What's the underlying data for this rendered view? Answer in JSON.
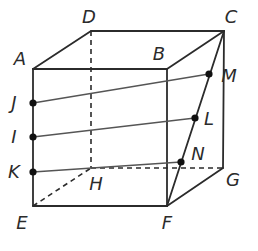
{
  "diagram": {
    "type": "cube-with-cross-section",
    "vertices": {
      "A": {
        "label": "A",
        "x": 33,
        "y": 69,
        "lx": 20,
        "ly": 59
      },
      "B": {
        "label": "B",
        "x": 167,
        "y": 69,
        "lx": 159,
        "ly": 54
      },
      "C": {
        "label": "C",
        "x": 224,
        "y": 31,
        "lx": 231,
        "ly": 17
      },
      "D": {
        "label": "D",
        "x": 91,
        "y": 31,
        "lx": 89,
        "ly": 17
      },
      "E": {
        "label": "E",
        "x": 33,
        "y": 206,
        "lx": 22,
        "ly": 223
      },
      "F": {
        "label": "F",
        "x": 167,
        "y": 206,
        "lx": 167,
        "ly": 223
      },
      "G": {
        "label": "G",
        "x": 223,
        "y": 168,
        "lx": 233,
        "ly": 180
      },
      "H": {
        "label": "H",
        "x": 91,
        "y": 168,
        "lx": 96,
        "ly": 184
      }
    },
    "points": {
      "J": {
        "label": "J",
        "x": 33,
        "y": 103,
        "lx": 14,
        "ly": 103
      },
      "I": {
        "label": "I",
        "x": 33,
        "y": 137,
        "lx": 14,
        "ly": 137
      },
      "K": {
        "label": "K",
        "x": 33,
        "y": 172,
        "lx": 14,
        "ly": 172
      },
      "M": {
        "label": "M",
        "x": 209,
        "y": 74,
        "lx": 229,
        "ly": 76
      },
      "L": {
        "label": "L",
        "x": 195,
        "y": 118,
        "lx": 209,
        "ly": 119
      },
      "N": {
        "label": "N",
        "x": 181,
        "y": 162,
        "lx": 198,
        "ly": 154
      }
    },
    "visible_edges": [
      [
        "A",
        "B"
      ],
      [
        "A",
        "D"
      ],
      [
        "D",
        "C"
      ],
      [
        "B",
        "C"
      ],
      [
        "A",
        "E"
      ],
      [
        "B",
        "F"
      ],
      [
        "C",
        "G"
      ],
      [
        "E",
        "F"
      ],
      [
        "F",
        "G"
      ],
      [
        "C",
        "F"
      ]
    ],
    "hidden_edges": [
      [
        "D",
        "H"
      ],
      [
        "E",
        "H"
      ],
      [
        "H",
        "G"
      ]
    ],
    "segments": [
      [
        "J",
        "M"
      ],
      [
        "I",
        "L"
      ],
      [
        "K",
        "N"
      ]
    ],
    "colors": {
      "edge": "#2b2b2b",
      "segment": "#555555",
      "point": "#111111",
      "background": "#ffffff"
    }
  }
}
